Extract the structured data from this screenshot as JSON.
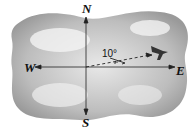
{
  "diagram": {
    "type": "compass-bearing",
    "labels": {
      "north": "N",
      "south": "S",
      "east": "E",
      "west": "W"
    },
    "angle_label": "10°",
    "heading_description": "airplane path 10° north of east",
    "colors": {
      "cloud": "#9a9a9a",
      "lines": "#222222",
      "background": "#ffffff"
    }
  }
}
